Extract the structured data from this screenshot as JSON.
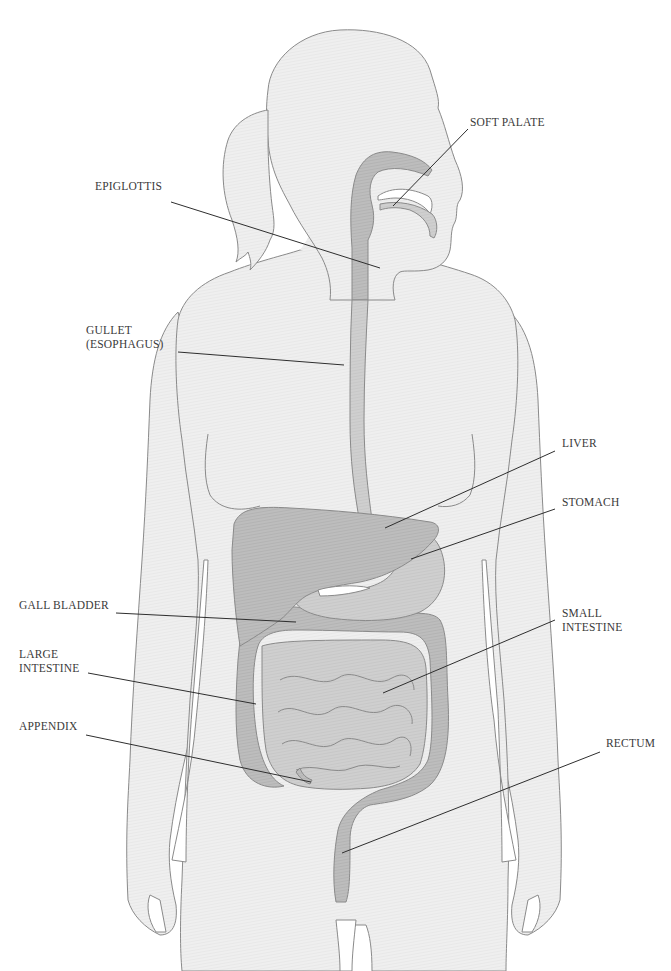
{
  "diagram": {
    "colors": {
      "background": "#ffffff",
      "skin_fill": "#eeeeee",
      "outline": "#8a8a8a",
      "organ_fill": "#b9b9b9",
      "organ_dark": "#a6a6a6",
      "leader_line": "#2e2e2e",
      "label_text": "#3a3a3a"
    },
    "labels": [
      {
        "id": "soft-palate",
        "text": "SOFT PALATE",
        "x": 470,
        "y": 122,
        "line": [
          468,
          129,
          393,
          206
        ]
      },
      {
        "id": "epiglottis",
        "text": "EPIGLOTTIS",
        "x": 95,
        "y": 186,
        "line": [
          171,
          202,
          380,
          268
        ]
      },
      {
        "id": "gullet",
        "text": "GULLET\n(ESOPHAGUS)",
        "x": 86,
        "y": 330,
        "line": [
          178,
          352,
          344,
          365
        ]
      },
      {
        "id": "liver",
        "text": "LIVER",
        "x": 562,
        "y": 443,
        "line": [
          555,
          451,
          385,
          528
        ]
      },
      {
        "id": "stomach",
        "text": "STOMACH",
        "x": 562,
        "y": 502,
        "line": [
          555,
          509,
          411,
          559
        ]
      },
      {
        "id": "gall-bladder",
        "text": "GALL BLADDER",
        "x": 19,
        "y": 605,
        "line": [
          116,
          613,
          296,
          622
        ]
      },
      {
        "id": "large-intestine",
        "text": "LARGE\nINTESTINE",
        "x": 19,
        "y": 654,
        "line": [
          88,
          673,
          256,
          704
        ]
      },
      {
        "id": "small-intestine",
        "text": "SMALL\nINTESTINE",
        "x": 562,
        "y": 613,
        "line": [
          555,
          620,
          383,
          693
        ]
      },
      {
        "id": "appendix",
        "text": "APPENDIX",
        "x": 19,
        "y": 726,
        "line": [
          86,
          735,
          311,
          782
        ]
      },
      {
        "id": "rectum",
        "text": "RECTUM",
        "x": 606,
        "y": 743,
        "line": [
          600,
          752,
          342,
          853
        ]
      }
    ]
  }
}
